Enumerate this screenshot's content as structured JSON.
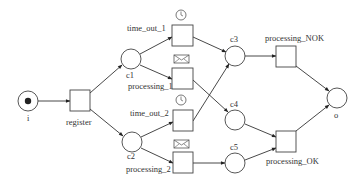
{
  "diagram": {
    "type": "petri-net",
    "colors": {
      "stroke": "#444444",
      "text": "#333333",
      "background": "#ffffff",
      "token": "#222222"
    },
    "places": [
      {
        "id": "i",
        "label": "i",
        "cx": 28,
        "cy": 101,
        "tokens": 1
      },
      {
        "id": "c1",
        "label": "c1",
        "cx": 131,
        "cy": 59,
        "tokens": 0
      },
      {
        "id": "c2",
        "label": "c2",
        "cx": 132,
        "cy": 142,
        "tokens": 0
      },
      {
        "id": "c3",
        "label": "c3",
        "cx": 235,
        "cy": 56,
        "tokens": 0
      },
      {
        "id": "c4",
        "label": "c4",
        "cx": 235,
        "cy": 120,
        "tokens": 0
      },
      {
        "id": "c5",
        "label": "c5",
        "cx": 235,
        "cy": 163,
        "tokens": 0
      },
      {
        "id": "o",
        "label": "o",
        "cx": 337,
        "cy": 98,
        "tokens": 0
      }
    ],
    "transitions": [
      {
        "id": "register",
        "label": "register",
        "trigger": null
      },
      {
        "id": "time_out_1",
        "label": "time_out_1",
        "trigger": "clock-icon"
      },
      {
        "id": "processing_1",
        "label": "processing_1",
        "trigger": "envelope-icon"
      },
      {
        "id": "time_out_2",
        "label": "time_out_2",
        "trigger": "clock-icon"
      },
      {
        "id": "processing_2",
        "label": "processing_2",
        "trigger": "envelope-icon"
      },
      {
        "id": "processing_NOK",
        "label": "processing_NOK",
        "trigger": null
      },
      {
        "id": "processing_OK",
        "label": "processing_OK",
        "trigger": null
      }
    ],
    "arcs": [
      [
        "i",
        "register"
      ],
      [
        "register",
        "c1"
      ],
      [
        "register",
        "c2"
      ],
      [
        "c1",
        "time_out_1"
      ],
      [
        "c1",
        "processing_1"
      ],
      [
        "c2",
        "time_out_2"
      ],
      [
        "c2",
        "processing_2"
      ],
      [
        "time_out_1",
        "c3"
      ],
      [
        "processing_1",
        "c4"
      ],
      [
        "time_out_2",
        "c3"
      ],
      [
        "processing_2",
        "c5"
      ],
      [
        "c3",
        "processing_NOK"
      ],
      [
        "c4",
        "processing_OK"
      ],
      [
        "c5",
        "processing_OK"
      ],
      [
        "processing_NOK",
        "o"
      ],
      [
        "processing_OK",
        "o"
      ]
    ]
  },
  "labels": {
    "i": "i",
    "register": "register",
    "c1": "c1",
    "c2": "c2",
    "c3": "c3",
    "c4": "c4",
    "c5": "c5",
    "o": "o",
    "time_out_1": "time_out_1",
    "processing_1": "processing_1",
    "time_out_2": "time_out_2",
    "processing_2": "processing_2",
    "processing_NOK": "processing_NOK",
    "processing_OK": "processing_OK"
  }
}
